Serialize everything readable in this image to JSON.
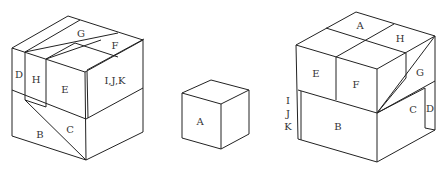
{
  "figure": {
    "colors": {
      "line": "#222222",
      "label": "#333333",
      "background": "#ffffff"
    }
  },
  "left_cube": {
    "labels": {
      "D": "D",
      "H": "H",
      "G": "G",
      "F": "F",
      "E": "E",
      "IJK": "I,J,K",
      "B": "B",
      "C": "C"
    }
  },
  "center_cube": {
    "labels": {
      "A": "A"
    }
  },
  "right_cube": {
    "labels": {
      "A": "A",
      "H": "H",
      "E": "E",
      "F": "F",
      "G": "G",
      "C": "C",
      "D": "D",
      "B": "B",
      "I": "I",
      "J": "J",
      "K": "K"
    }
  }
}
